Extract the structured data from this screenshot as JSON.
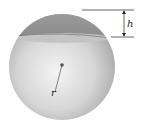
{
  "diagram": {
    "labels": {
      "height": "h",
      "radius": "r"
    },
    "colors": {
      "cap": "#8e8e8e",
      "sphere_light": "#f2f2f2",
      "sphere_dark": "#9a9a9a",
      "lines": "#222222"
    }
  }
}
